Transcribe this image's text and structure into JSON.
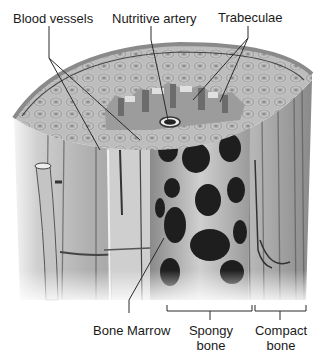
{
  "diagram": {
    "labels": {
      "blood_vessels": "Blood vessels",
      "nutritive_artery": "Nutritive artery",
      "trabeculae": "Trabeculae",
      "bone_marrow": "Bone Marrow",
      "spongy_bone_line1": "Spongy",
      "spongy_bone_line2": "bone",
      "compact_bone_line1": "Compact",
      "compact_bone_line2": "bone"
    },
    "colors": {
      "background": "#ffffff",
      "bone_light": "#d4d4d4",
      "bone_mid": "#a8a8a8",
      "bone_dark": "#3a3a3a",
      "marrow_cavity": "#1c1c1c",
      "label_text": "#1a1a1a",
      "leader_line": "#2a2a2a"
    }
  }
}
